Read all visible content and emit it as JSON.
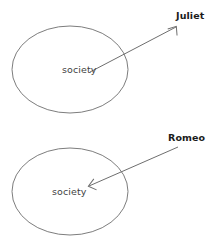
{
  "diagram": {
    "type": "relationship-diagram",
    "background_color": "#ffffff",
    "shape_stroke_color": "#7d7d7d",
    "arrow_color": "#6e6e6e",
    "inner_label_color": "#3f3f3f",
    "outer_label_color": "#1b1b1b",
    "panels": [
      {
        "id": "top",
        "inner_label": "society",
        "outer_label": "Juliet",
        "arrow_direction": "outward",
        "arrow_from": "society",
        "arrow_to": "Juliet"
      },
      {
        "id": "bottom",
        "inner_label": "society",
        "outer_label": "Romeo",
        "arrow_direction": "inward",
        "arrow_from": "Romeo",
        "arrow_to": "society"
      }
    ]
  }
}
